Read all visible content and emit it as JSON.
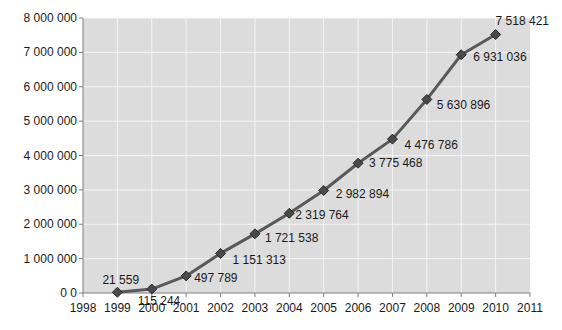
{
  "chart_data": {
    "type": "line",
    "title": "",
    "xlabel": "",
    "ylabel": "",
    "x": [
      1999,
      2000,
      2001,
      2002,
      2003,
      2004,
      2005,
      2006,
      2007,
      2008,
      2009,
      2010
    ],
    "series": [
      {
        "name": "Series 1",
        "values": [
          21559,
          115244,
          497789,
          1151313,
          1721538,
          2319764,
          2982894,
          3775468,
          4476786,
          5630896,
          6931036,
          7518421
        ],
        "labels": [
          "21 559",
          "115 244",
          "497 789",
          "1 151 313",
          "1 721 538",
          "2 319 764",
          "2 982 894",
          "3 775 468",
          "4 476 786",
          "5 630 896",
          "6 931 036",
          "7 518 421"
        ],
        "marker": "diamond",
        "color": "#595959",
        "marker_color": "#4a4a4a"
      }
    ],
    "xlim": [
      1998,
      2011
    ],
    "ylim": [
      0,
      8000000
    ],
    "x_ticks": [
      "1998",
      "1999",
      "2000",
      "2001",
      "2002",
      "2003",
      "2004",
      "2005",
      "2006",
      "2007",
      "2008",
      "2009",
      "2010",
      "2011"
    ],
    "y_ticks": [
      "0 0",
      "1 000 000",
      "2 000 000",
      "3 000 000",
      "4 000 000",
      "5 000 000",
      "6 000 000",
      "7 000 000",
      "8 000 000"
    ],
    "grid": true,
    "legend": null,
    "plot_background": "#dcdcdc",
    "grid_color": "#f4f4f4"
  }
}
